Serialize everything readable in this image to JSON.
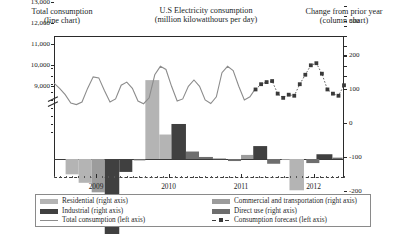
{
  "headers": {
    "left": {
      "line1": "Total consumption",
      "line2": "(line chart)"
    },
    "middle": {
      "line1": "U.S Electricity consumption",
      "line2": "(million kilowatthours per day)"
    },
    "right": {
      "line1": "Change from prior year",
      "line2": "(column chart)"
    }
  },
  "legend": {
    "column1": [
      {
        "label": "Residential (right axis)",
        "marker": "swatch",
        "color": "#b4b4b4"
      },
      {
        "label": "Industrial (right axis)",
        "marker": "swatch",
        "color": "#404040"
      },
      {
        "label": "Total consumption (left axis)",
        "marker": "line",
        "color": "#8c8c8c"
      }
    ],
    "column2": [
      {
        "label": "Commercial and transportation (right axis)",
        "marker": "swatch",
        "color": "#9c9c9c"
      },
      {
        "label": "Direct use (right axis)",
        "marker": "swatch",
        "color": "#6e6e6e"
      },
      {
        "label": "Consumption forecast (left axis)",
        "marker": "dashed-marker",
        "color": "#3a3a3a"
      }
    ]
  },
  "colors": {
    "residential": "#b4b4b4",
    "commercial": "#9c9c9c",
    "direct_use": "#6e6e6e",
    "industrial": "#404040",
    "total_line": "#8c8c8c",
    "forecast": "#3a3a3a",
    "axis": "#2a2a2a"
  },
  "chart_data": {
    "type": "line",
    "title": "U.S Electricity consumption (million kilowatthours per day)",
    "subtitle_left": "Total consumption (line chart)",
    "subtitle_right": "Change from prior year (column chart)",
    "xlabel": "",
    "ylabel_left": "million kilowatthours per day",
    "ylabel_right": "Change from prior year",
    "grid": false,
    "legend_position": "bottom",
    "x_tick_labels": [
      "2009",
      "2010",
      "2011",
      "2012"
    ],
    "x_tick_positions": [
      0.145,
      0.395,
      0.645,
      0.895
    ],
    "left_axis": {
      "ticks": [
        "13,000",
        "12,000",
        "11,000",
        "10,000",
        "9,000"
      ],
      "values": [
        13000,
        12000,
        11000,
        10000,
        9000
      ],
      "ylim": [
        9000,
        13000
      ],
      "axis_break": true
    },
    "right_axis": {
      "ticks": [
        "300",
        "200",
        "100",
        "0",
        "-100",
        "-200",
        "-300"
      ],
      "values": [
        300,
        200,
        100,
        0,
        -100,
        -200,
        -300
      ],
      "ylim": [
        -300,
        300
      ]
    },
    "series": [
      {
        "name": "Total consumption (left axis)",
        "type": "line",
        "axis": "left",
        "color": "#8c8c8c",
        "values": [
          10850,
          10600,
          10300,
          9900,
          9830,
          9950,
          10600,
          11150,
          11100,
          10500,
          9950,
          10100,
          10750,
          10900,
          10600,
          10000,
          9870,
          10150,
          11250,
          11650,
          11500,
          10700,
          10000,
          10100,
          10700,
          11000,
          10700,
          10050,
          9880,
          10200,
          11350,
          11650,
          11450,
          10700,
          10050,
          10200,
          10600
        ]
      },
      {
        "name": "Consumption forecast (left axis)",
        "type": "line-dashed-markers",
        "axis": "left",
        "color": "#3a3a3a",
        "values": [
          10550,
          10800,
          10900,
          10950,
          10350,
          10150,
          10300,
          10250,
          10800,
          11250,
          11700,
          11800,
          11300,
          10550,
          10350,
          10250,
          10750
        ]
      },
      {
        "name": "Residential (right axis)",
        "type": "column",
        "axis": "right",
        "color": "#b4b4b4",
        "values": [
          -45,
          -70,
          -95,
          -255,
          -35,
          0,
          230,
          75,
          100,
          25,
          5,
          0,
          0,
          10,
          35,
          -15,
          0,
          -90,
          -15,
          10,
          5
        ]
      },
      {
        "name": "Commercial and transportation (right axis)",
        "type": "column",
        "axis": "right",
        "color": "#9c9c9c"
      },
      {
        "name": "Direct use (right axis)",
        "type": "column",
        "axis": "right",
        "color": "#6e6e6e"
      },
      {
        "name": "Industrial (right axis)",
        "type": "column",
        "axis": "right",
        "color": "#404040"
      }
    ],
    "columns": [
      {
        "x": 0.04,
        "w": 0.045,
        "value": -45,
        "color": "#b4b4b4"
      },
      {
        "x": 0.085,
        "w": 0.045,
        "value": -70,
        "color": "#b4b4b4"
      },
      {
        "x": 0.13,
        "w": 0.045,
        "value": -98,
        "color": "#9c9c9c"
      },
      {
        "x": 0.175,
        "w": 0.05,
        "value": -258,
        "color": "#404040"
      },
      {
        "x": 0.225,
        "w": 0.045,
        "value": -38,
        "color": "#404040"
      },
      {
        "x": 0.275,
        "w": 0.04,
        "value": -4,
        "color": "#6e6e6e"
      },
      {
        "x": 0.315,
        "w": 0.048,
        "value": 232,
        "color": "#b4b4b4"
      },
      {
        "x": 0.363,
        "w": 0.042,
        "value": 72,
        "color": "#b4b4b4"
      },
      {
        "x": 0.405,
        "w": 0.05,
        "value": 103,
        "color": "#404040"
      },
      {
        "x": 0.455,
        "w": 0.045,
        "value": 22,
        "color": "#6e6e6e"
      },
      {
        "x": 0.5,
        "w": 0.048,
        "value": 6,
        "color": "#6e6e6e"
      },
      {
        "x": 0.548,
        "w": 0.045,
        "value": 2,
        "color": "#9c9c9c"
      },
      {
        "x": 0.6,
        "w": 0.045,
        "value": -6,
        "color": "#6e6e6e"
      },
      {
        "x": 0.645,
        "w": 0.042,
        "value": 12,
        "color": "#9c9c9c"
      },
      {
        "x": 0.687,
        "w": 0.048,
        "value": 38,
        "color": "#404040"
      },
      {
        "x": 0.735,
        "w": 0.045,
        "value": -14,
        "color": "#6e6e6e"
      },
      {
        "x": 0.785,
        "w": 0.048,
        "value": -3,
        "color": "#9c9c9c"
      },
      {
        "x": 0.812,
        "w": 0.05,
        "value": -92,
        "color": "#b4b4b4"
      },
      {
        "x": 0.87,
        "w": 0.045,
        "value": -12,
        "color": "#6e6e6e"
      },
      {
        "x": 0.905,
        "w": 0.055,
        "value": 14,
        "color": "#404040"
      },
      {
        "x": 0.96,
        "w": 0.035,
        "value": 4,
        "color": "#6e6e6e"
      }
    ]
  }
}
